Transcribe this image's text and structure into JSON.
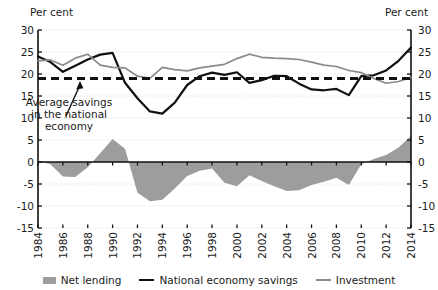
{
  "chart_data": {
    "type": "area",
    "title": "",
    "xlabel": "",
    "ylabel": "Per cent",
    "ylabel_right": "Per cent",
    "ylim": [
      -15,
      30
    ],
    "yticks": [
      30,
      25,
      20,
      15,
      10,
      5,
      0,
      -5,
      -10,
      -15
    ],
    "grid": true,
    "legend_position": "bottom",
    "x": [
      1984,
      1985,
      1986,
      1987,
      1988,
      1989,
      1990,
      1991,
      1992,
      1993,
      1994,
      1995,
      1996,
      1997,
      1998,
      1999,
      2000,
      2001,
      2002,
      2003,
      2004,
      2005,
      2006,
      2007,
      2008,
      2009,
      2010,
      2011,
      2012,
      2013,
      2014
    ],
    "xtick_labels": [
      "1984",
      "1986",
      "1988",
      "1990",
      "1992",
      "1994",
      "1996",
      "1998",
      "2000",
      "2002",
      "2004",
      "2006",
      "2008",
      "2010",
      "2012",
      "2014"
    ],
    "series": [
      {
        "name": "Net lending",
        "type": "area",
        "color": "#9d9d9d",
        "values": [
          0.2,
          -0.5,
          -3.3,
          -3.4,
          -1.2,
          2.0,
          5.2,
          3.0,
          -7.0,
          -8.9,
          -8.6,
          -6.0,
          -3.2,
          -2.0,
          -1.5,
          -4.7,
          -5.5,
          -3.0,
          -4.3,
          -5.5,
          -6.6,
          -6.4,
          -5.2,
          -4.5,
          -3.6,
          -5.2,
          -0.5,
          0.7,
          1.6,
          3.3,
          5.9
        ]
      },
      {
        "name": "National economy savings",
        "type": "line",
        "color": "#111111",
        "values": [
          24.0,
          22.7,
          20.5,
          21.9,
          23.3,
          24.4,
          24.8,
          18.0,
          14.5,
          11.5,
          11.0,
          13.5,
          17.5,
          19.5,
          20.3,
          19.8,
          20.4,
          18.0,
          18.6,
          19.6,
          19.5,
          17.8,
          16.5,
          16.3,
          16.6,
          15.2,
          19.5,
          19.7,
          20.8,
          23.0,
          26.0
        ]
      },
      {
        "name": "Investment",
        "type": "line",
        "color": "#8a8a8a",
        "values": [
          23.0,
          23.2,
          22.0,
          23.6,
          24.5,
          22.0,
          21.5,
          21.4,
          19.5,
          19.0,
          21.5,
          21.0,
          20.7,
          21.4,
          21.8,
          22.2,
          23.5,
          24.5,
          23.8,
          23.6,
          23.5,
          23.3,
          22.7,
          22.0,
          21.7,
          20.8,
          20.3,
          19.0,
          17.9,
          18.3,
          19.2
        ]
      }
    ],
    "reference_line": {
      "label": "Average savings in the national economy",
      "value": 19.0,
      "style": "dashed",
      "color": "#111111"
    },
    "annotation": {
      "lines": [
        "Average savings",
        "in the national",
        "economy"
      ]
    }
  }
}
